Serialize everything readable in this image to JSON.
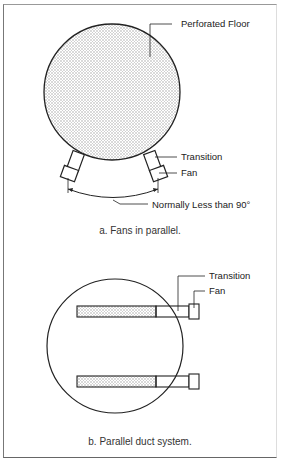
{
  "figure_a": {
    "labels": {
      "perforated_floor": "Perforated Floor",
      "transition": "Transition",
      "fan": "Fan",
      "angle": "Normally Less than 90°"
    },
    "caption": "a. Fans in parallel."
  },
  "figure_b": {
    "labels": {
      "transition": "Transition",
      "fan": "Fan"
    },
    "caption": "b. Parallel duct system."
  },
  "colors": {
    "line": "#222222",
    "fill_pattern": "#bbbbbb",
    "frame": "#777777"
  }
}
